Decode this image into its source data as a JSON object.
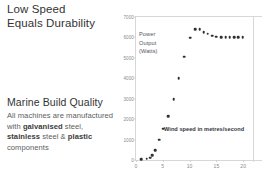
{
  "left_panel": {
    "headline_lines": [
      "Low Speed",
      "Equals Durability"
    ],
    "section_title": "Marine Build Quality",
    "body_prefix": "All machines are manufactured with ",
    "body_bold_1": "galvanised",
    "body_mid_1": " steel, ",
    "body_bold_2": "stainless",
    "body_mid_2": " steel & ",
    "body_bold_3": "plastic",
    "body_suffix": " components"
  },
  "chart_data": {
    "type": "scatter",
    "title": "",
    "series_annotation_lines": [
      "Power",
      "Output",
      "(Watts)"
    ],
    "xlabel": "Wind speed in metres/second",
    "ylabel": "Power Output (Watts)",
    "xlim": [
      0,
      25
    ],
    "ylim": [
      0,
      7000
    ],
    "xticks": [
      0,
      5,
      10,
      15,
      20,
      25
    ],
    "yticks": [
      0,
      1000,
      2000,
      3000,
      4000,
      5000,
      6000,
      7000
    ],
    "grid": false,
    "legend": "none",
    "marker_color": "#2f2f33",
    "series": [
      {
        "name": "Power Output (Watts)",
        "points": [
          [
            1.0,
            40
          ],
          [
            2.0,
            60
          ],
          [
            2.6,
            110
          ],
          [
            3.0,
            230
          ],
          [
            3.6,
            480
          ],
          [
            4.3,
            1000
          ],
          [
            5.1,
            1530
          ],
          [
            6.0,
            2150
          ],
          [
            7.0,
            2970
          ],
          [
            8.0,
            4000
          ],
          [
            9.0,
            5050
          ],
          [
            10.1,
            5980
          ],
          [
            11.0,
            6400
          ],
          [
            11.9,
            6390
          ],
          [
            12.6,
            6250
          ],
          [
            13.4,
            6180
          ],
          [
            14.2,
            6090
          ],
          [
            15.0,
            6030
          ],
          [
            15.9,
            6020
          ],
          [
            16.7,
            6020
          ],
          [
            17.5,
            6020
          ],
          [
            18.3,
            6020
          ],
          [
            19.1,
            6020
          ],
          [
            19.9,
            6020
          ]
        ]
      }
    ]
  }
}
